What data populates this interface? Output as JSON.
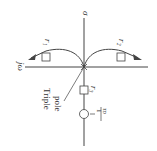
{
  "diagram": {
    "type": "root-locus",
    "orientation": "rotated-90",
    "axes": {
      "real_axis_label": "σ",
      "imag_axis_label": "jω"
    },
    "branches": [
      {
        "id": "r1",
        "label": "r₁"
      },
      {
        "id": "r2",
        "label": "r₂"
      },
      {
        "id": "r3",
        "label": "r₃"
      }
    ],
    "triple_pole": {
      "label_line1": "Triple",
      "label_line2": "pole"
    },
    "zero": {
      "label_num": "1",
      "label_den": "τᴅ",
      "sign": "−"
    },
    "colors": {
      "line": "#444444",
      "marker_fill": "#ffffff"
    }
  }
}
